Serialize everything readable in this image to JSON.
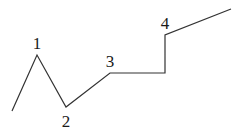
{
  "diagram": {
    "stroke_color": "#333333",
    "text_color": "#1a1a1a",
    "background": "#ffffff",
    "polyline_points": [
      [
        12,
        111
      ],
      [
        37,
        55
      ],
      [
        66,
        107
      ],
      [
        110,
        73
      ],
      [
        165,
        73
      ],
      [
        165,
        35
      ],
      [
        231,
        9
      ]
    ],
    "labels": [
      {
        "text": "1",
        "x": 37,
        "y": 49
      },
      {
        "text": "2",
        "x": 66,
        "y": 127
      },
      {
        "text": "3",
        "x": 110,
        "y": 67
      },
      {
        "text": "4",
        "x": 165,
        "y": 29
      }
    ]
  }
}
